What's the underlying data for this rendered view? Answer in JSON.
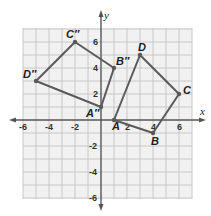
{
  "diagram": {
    "type": "coordinate-plane-transformation",
    "axes": {
      "x_label": "x",
      "y_label": "y",
      "x_ticks": [
        -6,
        -4,
        -2,
        2,
        4,
        6
      ],
      "y_ticks": [
        6,
        4,
        2,
        -2,
        -4,
        -6
      ],
      "grid_range": {
        "xmin": -6,
        "xmax": 7,
        "ymin": -6,
        "ymax": 7
      }
    },
    "figures": [
      {
        "name": "ABCD",
        "vertices": [
          {
            "label": "A",
            "x": 1,
            "y": 0
          },
          {
            "label": "B",
            "x": 4,
            "y": -1
          },
          {
            "label": "C",
            "x": 6,
            "y": 2
          },
          {
            "label": "D",
            "x": 3,
            "y": 5
          }
        ]
      },
      {
        "name": "A''B''C''D''",
        "vertices": [
          {
            "label": "A″",
            "x": 0,
            "y": 1
          },
          {
            "label": "B″",
            "x": 1,
            "y": 4
          },
          {
            "label": "C″",
            "x": -2,
            "y": 6
          },
          {
            "label": "D″",
            "x": -5,
            "y": 3
          }
        ]
      }
    ],
    "colors": {
      "background": "#f1f1f1",
      "grid": "#c4c4c4",
      "axis": "#555555",
      "figure_stroke": "#5a5a5a",
      "text": "#222222"
    }
  }
}
